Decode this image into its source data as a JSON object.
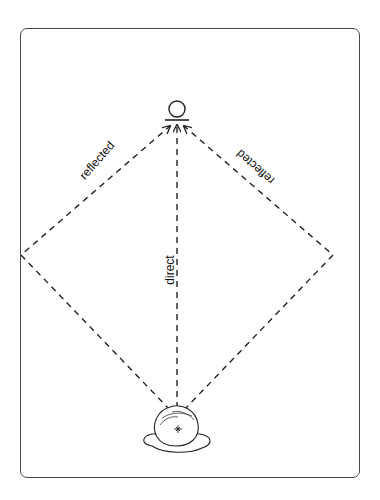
{
  "diagram": {
    "type": "sound-path-diagram",
    "labels": {
      "direct": "direct",
      "reflected_left": "reflected",
      "reflected_right": "reflected"
    },
    "elements": {
      "source": "microphone-icon",
      "listener": "listener-head-icon"
    },
    "colors": {
      "line": "#222222",
      "frame": "#4a4a4a",
      "background": "#ffffff"
    }
  }
}
